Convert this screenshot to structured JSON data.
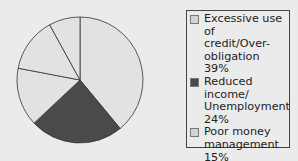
{
  "chart_data": {
    "type": "pie",
    "title": "",
    "categories": [
      "Excessive use of credit/Over-obligation",
      "Reduced income/Unemployment",
      "Poor money management",
      "Other",
      "Divorce/Separation"
    ],
    "values": [
      39,
      24,
      15,
      14,
      8
    ],
    "colors": [
      "#e2e2e2",
      "#4a4a4a",
      "#e2e2e2",
      "#e2e2e2",
      "#e2e2e2"
    ],
    "legend_position": "right"
  },
  "legend": [
    {
      "label": "Excessive use of\ncredit/Over-\nobligation 39%",
      "color": "#d4d4d4"
    },
    {
      "label": "Reduced income/\nUnemployment 24%",
      "color": "#4a4a4a"
    },
    {
      "label": "Poor money\nmanagement 15%",
      "color": "#d4d4d4"
    },
    {
      "label": "Divorce/\nSeparation 8%",
      "color": "#d4d4d4"
    },
    {
      "label": "Other 14%",
      "color": "#d4d4d4"
    }
  ]
}
